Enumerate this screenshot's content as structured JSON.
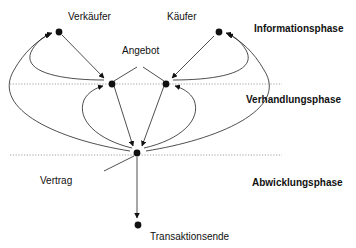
{
  "diagram": {
    "type": "transaction-phase-flow",
    "actors": {
      "seller": "Verkäufer",
      "buyer": "Käufer"
    },
    "labels": {
      "offer": "Angebot",
      "contract": "Vertrag",
      "end": "Transaktionsende"
    },
    "phases": [
      {
        "id": "information",
        "label": "Informationsphase"
      },
      {
        "id": "negotiation",
        "label": "Verhandlungsphase"
      },
      {
        "id": "settlement",
        "label": "Abwicklungsphase"
      }
    ],
    "nodes": [
      {
        "id": "seller",
        "phase": "information"
      },
      {
        "id": "buyer",
        "phase": "information"
      },
      {
        "id": "offer_seller",
        "phase": "negotiation"
      },
      {
        "id": "offer_buyer",
        "phase": "negotiation"
      },
      {
        "id": "contract",
        "phase": "settlement"
      },
      {
        "id": "end",
        "phase": "settlement"
      }
    ],
    "edges": [
      {
        "from": "seller",
        "to": "offer_seller"
      },
      {
        "from": "buyer",
        "to": "offer_buyer"
      },
      {
        "from": "offer_seller",
        "to": "seller"
      },
      {
        "from": "offer_buyer",
        "to": "buyer"
      },
      {
        "from": "offer_seller",
        "to": "contract"
      },
      {
        "from": "offer_buyer",
        "to": "contract"
      },
      {
        "from": "contract",
        "to": "offer_seller"
      },
      {
        "from": "contract",
        "to": "offer_buyer"
      },
      {
        "from": "contract",
        "to": "seller"
      },
      {
        "from": "contract",
        "to": "buyer"
      },
      {
        "from": "contract",
        "to": "end"
      }
    ],
    "colors": {
      "ink": "#111111",
      "separator": "#888888"
    }
  }
}
